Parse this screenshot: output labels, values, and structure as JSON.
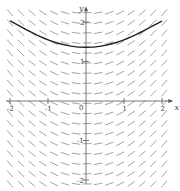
{
  "figure": {
    "type": "slope_field",
    "colors": {
      "background": "#ffffff",
      "axes": "#555555",
      "segments": "#9a9a9a",
      "curve": "#222222"
    }
  },
  "axes": {
    "x_label": "x",
    "y_label": "y",
    "x_ticks": [
      {
        "value": -2,
        "label": "-2"
      },
      {
        "value": -1,
        "label": "-1"
      },
      {
        "value": 0,
        "label": "0"
      },
      {
        "value": 1,
        "label": "1"
      },
      {
        "value": 2,
        "label": "2"
      }
    ],
    "y_ticks": [
      {
        "value": 2,
        "label": "2"
      },
      {
        "value": 1,
        "label": "1"
      },
      {
        "value": -1,
        "label": "-1"
      },
      {
        "value": -2,
        "label": "-2"
      }
    ],
    "origin_label": "0",
    "x_range": [
      -2.1,
      2.3
    ],
    "y_range": [
      -2.1,
      2.4
    ]
  },
  "mapping": {
    "origin_px": [
      86,
      101
    ],
    "unit_x_px": 38,
    "unit_y_px": 39.5
  },
  "slope_field": {
    "x_start": -2.0,
    "x_end": 2.1,
    "x_step": 0.29,
    "y_start": -2.1,
    "y_end": 2.25,
    "y_step": 0.255,
    "slope_coefficient": 0.55,
    "segment_length_px": 8
  },
  "solution_curve": {
    "points": [
      [
        -2.0,
        2.03
      ],
      [
        -1.6,
        1.82
      ],
      [
        -1.2,
        1.63
      ],
      [
        -0.8,
        1.48
      ],
      [
        -0.4,
        1.39
      ],
      [
        0.0,
        1.36
      ],
      [
        0.4,
        1.39
      ],
      [
        0.8,
        1.48
      ],
      [
        1.2,
        1.63
      ],
      [
        1.6,
        1.82
      ],
      [
        2.0,
        2.02
      ]
    ]
  }
}
